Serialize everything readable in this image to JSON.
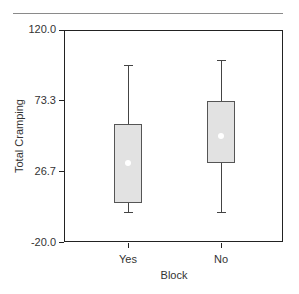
{
  "chart_data": {
    "type": "box",
    "title": "",
    "xlabel": "Block",
    "ylabel": "Total Cramping",
    "ylim": [
      -20.0,
      120.0
    ],
    "yticks": [
      "120.0",
      "73.3",
      "26.7",
      "-20.0"
    ],
    "categories": [
      "Yes",
      "No"
    ],
    "boxes": [
      {
        "category": "Yes",
        "whisker_low": 0,
        "q1": 6,
        "mean": 32,
        "q3": 58,
        "whisker_high": 97
      },
      {
        "category": "No",
        "whisker_low": 0,
        "q1": 32,
        "mean": 50,
        "q3": 73,
        "whisker_high": 100
      }
    ],
    "box_fill": "#e2e2e2",
    "mean_marker_color": "#ffffff",
    "grid": false,
    "legend": null
  },
  "axis": {
    "y_title": "Total Cramping",
    "x_title": "Block",
    "y_ticks": [
      {
        "label": "120.0",
        "value": 120.0
      },
      {
        "label": "73.3",
        "value": 73.3
      },
      {
        "label": "26.7",
        "value": 26.7
      },
      {
        "label": "-20.0",
        "value": -20.0
      }
    ],
    "x_ticks": [
      {
        "label": "Yes"
      },
      {
        "label": "No"
      }
    ]
  }
}
